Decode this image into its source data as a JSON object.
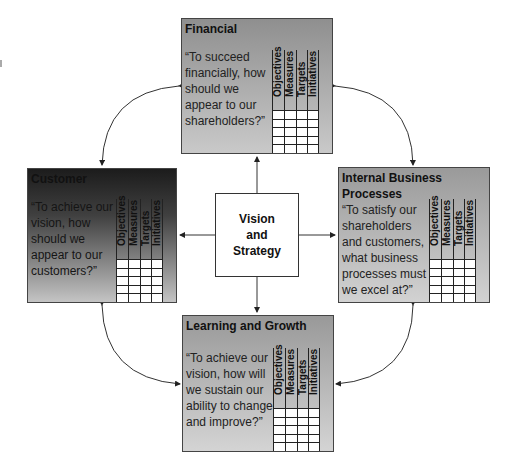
{
  "center": {
    "label": "Vision and Strategy"
  },
  "grid_columns": [
    "Objectives",
    "Measures",
    "Targets",
    "Initiatives"
  ],
  "perspectives": {
    "financial": {
      "title": "Financial",
      "question": "“To succeed financially, how should we appear to our shareholders?”"
    },
    "customer": {
      "title": "Customer",
      "question": "“To achieve our vision, how should we appear to our customers?”"
    },
    "internal": {
      "title": "Internal Business Processes",
      "question": "“To satisfy our shareholders and customers, what business processes must we excel at?”"
    },
    "learning": {
      "title": "Learning and Growth",
      "question": "“To achieve our vision, how will we sustain our ability to change and improve?”"
    }
  },
  "colors": {
    "box_light": "#c9c9c9",
    "box_dark": "#8f8f8f",
    "customer_dark": "#1c1c1c",
    "line": "#333333"
  }
}
